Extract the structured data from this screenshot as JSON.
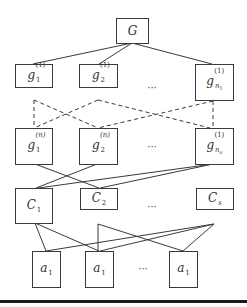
{
  "diagram": {
    "root": {
      "label": "G"
    },
    "level1": [
      {
        "base": "g",
        "sub": "1",
        "sup": "(1)"
      },
      {
        "base": "g",
        "sub": "2",
        "sup": "(1)"
      },
      {
        "base": "g",
        "sub": "n",
        "subsub": "1",
        "sup": "(1)"
      }
    ],
    "level2": [
      {
        "base": "g",
        "sub": "1",
        "sup": "(n)"
      },
      {
        "base": "g",
        "sub": "2",
        "sup": "(n)"
      },
      {
        "base": "g",
        "sub": "n",
        "subsub": "a",
        "sup": "(1)"
      }
    ],
    "level3": [
      {
        "base": "C",
        "sub": "1"
      },
      {
        "base": "C",
        "sub": "2"
      },
      {
        "base": "C",
        "sub": "s"
      }
    ],
    "level4": [
      {
        "base": "a",
        "sub": "1"
      },
      {
        "base": "a",
        "sub": "1"
      },
      {
        "base": "a",
        "sub": "1"
      }
    ],
    "ellipsis": "···",
    "edges": {
      "solid_root_to_level1": [
        [
          132,
          43,
          33,
          64
        ],
        [
          132,
          43,
          99,
          64
        ],
        [
          132,
          43,
          212,
          64
        ]
      ],
      "dashed_level1_to_level2": [
        [
          34,
          100,
          34,
          128
        ],
        [
          34,
          100,
          98,
          128
        ],
        [
          98,
          100,
          34,
          128
        ],
        [
          98,
          100,
          210,
          128
        ],
        [
          213,
          101,
          98,
          128
        ],
        [
          213,
          101,
          213,
          128
        ]
      ],
      "solid_level2_to_level3": [
        [
          35,
          164,
          99,
          188
        ],
        [
          97,
          164,
          36,
          188
        ],
        [
          213,
          164,
          38,
          188
        ],
        [
          213,
          164,
          100,
          188
        ]
      ],
      "solid_level3_to_level4": [
        [
          35,
          223,
          46,
          251
        ],
        [
          35,
          223,
          99,
          251
        ],
        [
          98,
          224,
          98,
          251
        ],
        [
          98,
          224,
          183,
          251
        ],
        [
          214,
          224,
          46,
          251
        ],
        [
          214,
          224,
          100,
          251
        ],
        [
          214,
          224,
          183,
          251
        ]
      ]
    },
    "colors": {
      "stroke": "#3a3a3a",
      "rule": "#1a1a1a",
      "background": "#ffffff"
    }
  }
}
